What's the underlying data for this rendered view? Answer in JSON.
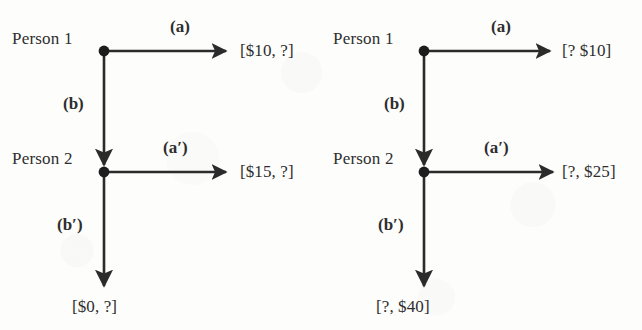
{
  "figure": {
    "type": "game-tree-pair",
    "background_color": "#fdfdfc",
    "ink_color": "#2b2b2b"
  },
  "diagrams": [
    {
      "id": "left",
      "players": [
        {
          "label": "Person 1"
        },
        {
          "label": "Person 2"
        }
      ],
      "edges": [
        {
          "label": "(a)",
          "direction": "right",
          "from_node": 1
        },
        {
          "label": "(b)",
          "direction": "down",
          "from_node": 1
        },
        {
          "label": "(a′)",
          "direction": "right",
          "from_node": 2
        },
        {
          "label": "(b′)",
          "direction": "down",
          "from_node": 2
        }
      ],
      "payoffs": [
        {
          "label": "[$10, ?]",
          "at": "node1-right"
        },
        {
          "label": "[$15, ?]",
          "at": "node2-right"
        },
        {
          "label": "[$0, ?]",
          "at": "node2-down"
        }
      ]
    },
    {
      "id": "right",
      "players": [
        {
          "label": "Person 1"
        },
        {
          "label": "Person 2"
        }
      ],
      "edges": [
        {
          "label": "(a)",
          "direction": "right",
          "from_node": 1
        },
        {
          "label": "(b)",
          "direction": "down",
          "from_node": 1
        },
        {
          "label": "(a′)",
          "direction": "right",
          "from_node": 2
        },
        {
          "label": "(b′)",
          "direction": "down",
          "from_node": 2
        }
      ],
      "payoffs": [
        {
          "label": "[? $10]",
          "at": "node1-right"
        },
        {
          "label": "[?, $25]",
          "at": "node2-right"
        },
        {
          "label": "[?, $40]",
          "at": "node2-down"
        }
      ]
    }
  ]
}
